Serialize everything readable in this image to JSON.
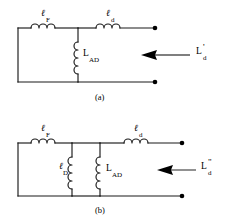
{
  "figure": {
    "background_color": "#ffffff",
    "line_color": "#1a1a1a",
    "arrow_color": "#555555",
    "panels": [
      {
        "id": "panel-a",
        "caption": "(a)",
        "components": [
          {
            "id": "l-F",
            "symbol": "inductor",
            "orientation": "horizontal",
            "main": "ℓ",
            "sub": "F"
          },
          {
            "id": "l-d",
            "symbol": "inductor",
            "orientation": "horizontal",
            "main": "ℓ",
            "sub": "d"
          },
          {
            "id": "L-AD",
            "symbol": "inductor",
            "orientation": "vertical",
            "main": "L",
            "sub": "AD"
          }
        ],
        "annotation": {
          "id": "Ld-prime",
          "main": "L",
          "prime": "'",
          "sub": "d",
          "arrow": "left"
        }
      },
      {
        "id": "panel-b",
        "caption": "(b)",
        "components": [
          {
            "id": "l-F",
            "symbol": "inductor",
            "orientation": "horizontal",
            "main": "ℓ",
            "sub": "F"
          },
          {
            "id": "l-d",
            "symbol": "inductor",
            "orientation": "horizontal",
            "main": "ℓ",
            "sub": "d"
          },
          {
            "id": "l-D",
            "symbol": "inductor",
            "orientation": "vertical",
            "main": "ℓ",
            "sub": "D"
          },
          {
            "id": "L-AD",
            "symbol": "inductor",
            "orientation": "vertical",
            "main": "L",
            "sub": "AD"
          }
        ],
        "annotation": {
          "id": "Ld-double-prime",
          "main": "L",
          "prime": "\"",
          "sub": "d",
          "arrow": "left"
        }
      }
    ]
  },
  "labels": {
    "a_lF_main": "ℓ",
    "a_lF_sub": "F",
    "a_ld_main": "ℓ",
    "a_ld_sub": "d",
    "a_LAD_main": "L",
    "a_LAD_sub": "AD",
    "a_Ld_main": "L",
    "a_Ld_prime": "'",
    "a_Ld_sub": "d",
    "a_caption": "(a)",
    "b_lF_main": "ℓ",
    "b_lF_sub": "F",
    "b_ld_main": "ℓ",
    "b_ld_sub": "d",
    "b_lD_main": "ℓ",
    "b_lD_sub": "D",
    "b_LAD_main": "L",
    "b_LAD_sub": "AD",
    "b_Ld_main": "L",
    "b_Ld_prime": "\"",
    "b_Ld_sub": "d",
    "b_caption": "(b)"
  }
}
